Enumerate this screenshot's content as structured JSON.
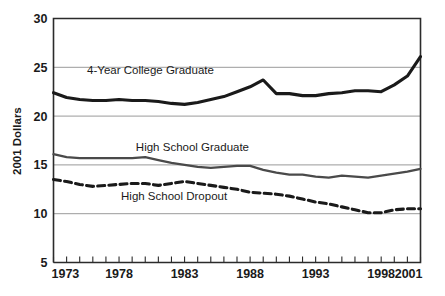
{
  "chart_data": {
    "type": "line",
    "title": "",
    "subtitle": "",
    "xlabel": "",
    "ylabel": "2001 Dollars",
    "xlim": [
      1973,
      2001
    ],
    "ylim": [
      5,
      30
    ],
    "y_ticks": [
      5,
      10,
      15,
      20,
      25,
      30
    ],
    "y_tick_labels": [
      "5",
      "10",
      "15",
      "20",
      "25",
      "30"
    ],
    "x_ticks": [
      1973,
      1974,
      1975,
      1976,
      1977,
      1978,
      1979,
      1980,
      1981,
      1982,
      1983,
      1984,
      1985,
      1986,
      1987,
      1988,
      1989,
      1990,
      1991,
      1992,
      1993,
      1994,
      1995,
      1996,
      1997,
      1998,
      1999,
      2000,
      2001
    ],
    "x_tick_labels_shown": [
      "1973",
      "1978",
      "1983",
      "1988",
      "1993",
      "1998",
      "2001"
    ],
    "x_tick_labels_shown_values": [
      1973,
      1978,
      1983,
      1988,
      1993,
      1998,
      2001
    ],
    "grid": "horizontal",
    "legend_position": "inline-annotations",
    "x": [
      1973,
      1974,
      1975,
      1976,
      1977,
      1978,
      1979,
      1980,
      1981,
      1982,
      1983,
      1984,
      1985,
      1986,
      1987,
      1988,
      1989,
      1990,
      1991,
      1992,
      1993,
      1994,
      1995,
      1996,
      1997,
      1998,
      1999,
      2000,
      2001
    ],
    "series": [
      {
        "name": "4-Year College Graduate",
        "color": "#1a1a1a",
        "style": "solid",
        "width": 3.1,
        "label_x": 1980.4,
        "label_y": 24.3,
        "values": [
          22.4,
          21.9,
          21.7,
          21.6,
          21.6,
          21.7,
          21.6,
          21.6,
          21.5,
          21.3,
          21.2,
          21.4,
          21.7,
          22.0,
          22.5,
          23.0,
          23.7,
          22.3,
          22.3,
          22.1,
          22.1,
          22.3,
          22.4,
          22.6,
          22.6,
          22.5,
          23.2,
          24.1,
          26.1
        ]
      },
      {
        "name": "High School Graduate",
        "color": "#4a4a4a",
        "style": "solid",
        "width": 2.3,
        "label_x": 1983.6,
        "label_y": 16.4,
        "values": [
          16.1,
          15.8,
          15.7,
          15.7,
          15.7,
          15.7,
          15.7,
          15.8,
          15.5,
          15.2,
          15.0,
          14.8,
          14.7,
          14.8,
          14.9,
          14.9,
          14.5,
          14.2,
          14.0,
          14.0,
          13.8,
          13.7,
          13.9,
          13.8,
          13.7,
          13.9,
          14.1,
          14.3,
          14.6
        ]
      },
      {
        "name": "High School Dropout",
        "color": "#1a1a1a",
        "style": "dashed",
        "width": 3.1,
        "label_x": 1982.2,
        "label_y": 11.4,
        "values": [
          13.5,
          13.3,
          13.0,
          12.8,
          12.9,
          13.0,
          13.1,
          13.1,
          12.9,
          13.1,
          13.3,
          13.1,
          12.9,
          12.7,
          12.5,
          12.2,
          12.1,
          12.0,
          11.8,
          11.5,
          11.2,
          11.0,
          10.7,
          10.4,
          10.1,
          10.1,
          10.4,
          10.5,
          10.5
        ]
      }
    ]
  },
  "axes": {
    "y_axis_title": "2001 Dollars"
  }
}
